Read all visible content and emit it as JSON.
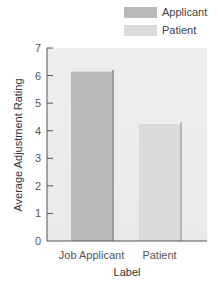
{
  "chart_data": {
    "type": "bar",
    "title": "",
    "xlabel": "Label",
    "ylabel": "Average Adjustment Rating",
    "categories": [
      "Job Applicant",
      "Patient"
    ],
    "series": [
      {
        "name": "Applicant",
        "category": "Job Applicant",
        "value": 6.2,
        "color": "#b9b9b9",
        "edge_color": "#9c9c9c"
      },
      {
        "name": "Patient",
        "category": "Patient",
        "value": 4.3,
        "color": "#dadada",
        "edge_color": "#b4b4b4"
      }
    ],
    "values": [
      6.2,
      4.3
    ],
    "ylim": [
      0,
      7
    ],
    "yticks": [
      0,
      1,
      2,
      3,
      4,
      5,
      6,
      7
    ],
    "grid": false,
    "legend": {
      "position": "top-right",
      "entries": [
        {
          "label": "Applicant",
          "color": "#b9b9b9"
        },
        {
          "label": "Patient",
          "color": "#dadada"
        }
      ]
    },
    "plot_background": "#ececec"
  }
}
